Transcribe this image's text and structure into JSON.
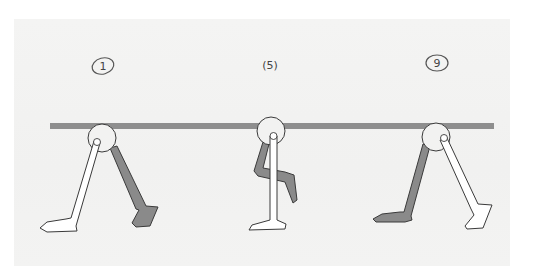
{
  "sketch": {
    "title": "Walk cycle leg poses",
    "colors": {
      "paper": "#f2f2f1",
      "bar": "#8e8e8e",
      "outline": "#3a3a3a",
      "front_leg_fill": "#ffffff",
      "back_leg_fill": "#8a8a8a"
    },
    "frames": [
      {
        "label": "1",
        "label_style": "circled",
        "pose": "contact"
      },
      {
        "label": "(5)",
        "label_style": "parenthesized",
        "pose": "passing"
      },
      {
        "label": "9",
        "label_style": "circled",
        "pose": "contact-opposite"
      }
    ]
  }
}
